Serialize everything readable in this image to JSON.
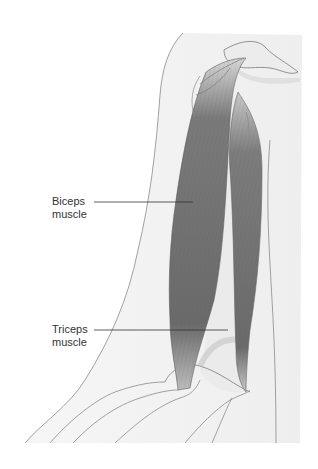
{
  "diagram": {
    "labels": [
      {
        "id": "biceps",
        "line1": "Biceps",
        "line2": "muscle"
      },
      {
        "id": "triceps",
        "line1": "Triceps",
        "line2": "muscle"
      }
    ],
    "colors": {
      "background": "#ffffff",
      "skin_fill": "#f2f2f2",
      "outline": "#8a8a8a",
      "muscle_dark": "#6e6e6e",
      "muscle_mid": "#8c8c8c",
      "bone_fill": "#ececec",
      "leader_line": "#333333",
      "text": "#333333"
    }
  }
}
